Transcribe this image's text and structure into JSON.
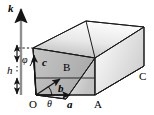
{
  "figure": {
    "kind": "geometry-diagram",
    "background": "#ffffff",
    "stroke": "#1a1a1a",
    "labels": {
      "k_axis": "k",
      "height": "h",
      "angle_phi": "φ",
      "angle_theta": "θ",
      "vector_a": "a",
      "vector_b": "b",
      "vector_c": "c",
      "origin": "O",
      "vertex_a": "A",
      "vertex_b": "B",
      "vertex_c": "C"
    },
    "faces": {
      "top_fill_light": "#f2f2f2",
      "top_fill_dark": "#b8b8b8",
      "front_fill_light": "#fbfbfb",
      "front_fill_dark": "#c9c9c9",
      "left_fill_light": "#cfcfcf",
      "left_fill_dark": "#a6a6a6",
      "right_fill_light": "#ffffff",
      "right_fill_dark": "#d4d4d4"
    }
  }
}
